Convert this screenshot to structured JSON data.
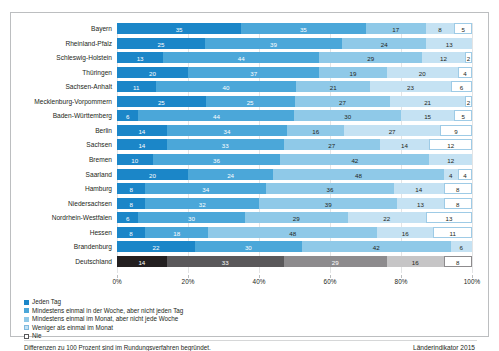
{
  "top_cut_text": " ",
  "chart_data": {
    "type": "bar",
    "subtype": "stacked-horizontal-100",
    "title": "",
    "xlabel": "",
    "ylabel": "",
    "xlim": [
      0,
      100
    ],
    "grid": true,
    "legend_position": "bottom-left",
    "tick_labels": [
      "0%",
      "20%",
      "40%",
      "60%",
      "80%",
      "100%"
    ],
    "tick_values": [
      0,
      20,
      40,
      60,
      80,
      100
    ],
    "categories": [
      "Bayern",
      "Rheinland-Pfalz",
      "Schleswig-Holstein",
      "Thüringen",
      "Sachsen-Anhalt",
      "Mecklenburg-Vorpommern",
      "Baden-Württemberg",
      "Berlin",
      "Sachsen",
      "Bremen",
      "Saarland",
      "Hamburg",
      "Niedersachsen",
      "Nordrhein-Westfalen",
      "Hessen",
      "Brandenburg",
      "Deutschland"
    ],
    "series": [
      {
        "name": "Jeden Tag",
        "values": [
          35,
          25,
          13,
          20,
          11,
          25,
          6,
          14,
          14,
          10,
          20,
          8,
          8,
          6,
          8,
          22,
          14
        ]
      },
      {
        "name": "Mindestens einmal in der Woche, aber nicht jeden Tag",
        "values": [
          35,
          39,
          44,
          37,
          40,
          25,
          44,
          34,
          33,
          36,
          24,
          34,
          32,
          30,
          18,
          30,
          33
        ]
      },
      {
        "name": "Mindestens einmal im Monat, aber nicht jede Woche",
        "values": [
          17,
          24,
          29,
          19,
          21,
          27,
          30,
          16,
          27,
          42,
          48,
          36,
          39,
          29,
          48,
          42,
          29
        ]
      },
      {
        "name": "Weniger als einmal im Monat",
        "values": [
          8,
          13,
          12,
          20,
          23,
          21,
          15,
          27,
          14,
          12,
          4,
          14,
          13,
          22,
          16,
          6,
          16
        ]
      },
      {
        "name": "Nie",
        "values": [
          5,
          0,
          2,
          4,
          6,
          2,
          5,
          9,
          12,
          0,
          4,
          8,
          8,
          13,
          11,
          0,
          8
        ]
      }
    ],
    "highlight_row": "Deutschland",
    "colors": {
      "series_0": "#1b86c8",
      "series_1": "#4ba7d9",
      "series_2": "#8fc9e8",
      "series_3": "#c5e2f3",
      "series_4": "#ffffff",
      "highlight_0": "#231f20",
      "highlight_1": "#5a585a",
      "highlight_2": "#8d8b8d",
      "highlight_3": "#c6c5c6",
      "highlight_4": "#ffffff"
    }
  },
  "legend": {
    "items": [
      "Jeden Tag",
      "Mindestens einmal in der Woche, aber nicht jeden Tag",
      "Mindestens einmal im Monat, aber nicht jede Woche",
      "Weniger als einmal im Monat",
      "Nie"
    ]
  },
  "footer": {
    "note": "Differenzen zu 100 Prozent sind im Rundungsverfahren begründet.",
    "source": "Länderindikator 2015"
  }
}
